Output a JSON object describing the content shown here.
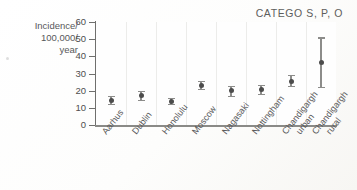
{
  "chart_data": {
    "type": "scatter",
    "title": "CATEGO S, P, O",
    "xlabel": "",
    "ylabel": "Incidence/ 100,000/ year",
    "ylabel_lines": [
      "Incidence/",
      "100,000/",
      "year"
    ],
    "ylim": [
      0,
      60
    ],
    "yticks": [
      0,
      10,
      20,
      30,
      40,
      50,
      60
    ],
    "ytick_labels": [
      "0",
      "10",
      "20",
      "30",
      "40",
      "50",
      "60"
    ],
    "grid": "vertical-only",
    "legend": "none",
    "categories": [
      "Aarhus",
      "Dublin",
      "Honolulu",
      "Moscow",
      "Nagasaki",
      "Nottingham",
      "Chandigargh urban",
      "Chandigargh rural"
    ],
    "values": [
      14.5,
      17.0,
      13.5,
      23.0,
      20.0,
      20.5,
      25.5,
      36.5
    ],
    "error_low": [
      12.5,
      14.5,
      12.0,
      21.0,
      17.0,
      18.0,
      22.5,
      22.0
    ],
    "error_high": [
      17.0,
      20.0,
      16.0,
      25.5,
      23.0,
      23.5,
      29.0,
      51.0
    ],
    "series": [
      {
        "name": "Incidence",
        "values": [
          14.5,
          17.0,
          13.5,
          23.0,
          20.0,
          20.5,
          25.5,
          36.5
        ]
      }
    ]
  },
  "colors": {
    "marker": "#4c4c4c",
    "error_bar": "#8c8c8a",
    "axis": "#6f6f6d",
    "gridline": "#ececea",
    "text": "#58585a",
    "background": "#ffffff"
  },
  "x_tick_labels": [
    {
      "line1": "Aarhus",
      "line2": ""
    },
    {
      "line1": "Dublin",
      "line2": ""
    },
    {
      "line1": "Honolulu",
      "line2": ""
    },
    {
      "line1": "Moscow",
      "line2": ""
    },
    {
      "line1": "Nagasaki",
      "line2": ""
    },
    {
      "line1": "Nottingham",
      "line2": ""
    },
    {
      "line1": "Chandigargh",
      "line2": "urban"
    },
    {
      "line1": "Chandigargh",
      "line2": "rural"
    }
  ]
}
